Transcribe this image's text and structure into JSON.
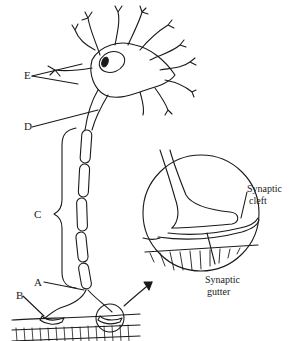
{
  "diagram": {
    "labels": {
      "E": "E",
      "D": "D",
      "C": "C",
      "A": "A",
      "B": "B"
    },
    "inset_labels": {
      "synaptic_cleft_line1": "Synaptic",
      "synaptic_cleft_line2": "cleft",
      "synaptic_gutter_line1": "Synaptic",
      "synaptic_gutter_line2": "gutter"
    },
    "colors": {
      "ink": "#1a1a1a",
      "background": "#ffffff"
    }
  }
}
